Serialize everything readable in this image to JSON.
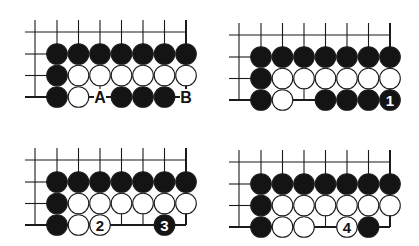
{
  "colors": {
    "background": "#ffffff",
    "line": "#1a1a1a",
    "black": "#141414",
    "white": "#ffffff"
  },
  "diagrams": [
    {
      "id": "diagram-1",
      "origin": [
        35,
        32
      ],
      "edge_right_col": 6,
      "bottom_edge_segments": [
        [
          -1,
          0
        ],
        [
          1,
          3
        ],
        [
          5,
          6
        ]
      ],
      "row_tops": [
        0,
        1,
        2,
        3,
        4,
        5,
        6
      ],
      "stones": [
        {
          "col": 0,
          "row": 0,
          "color": "black"
        },
        {
          "col": 1,
          "row": 0,
          "color": "black"
        },
        {
          "col": 2,
          "row": 0,
          "color": "black"
        },
        {
          "col": 3,
          "row": 0,
          "color": "black"
        },
        {
          "col": 4,
          "row": 0,
          "color": "black"
        },
        {
          "col": 5,
          "row": 0,
          "color": "black"
        },
        {
          "col": 6,
          "row": 0,
          "color": "black"
        },
        {
          "col": 0,
          "row": 1,
          "color": "black"
        },
        {
          "col": 1,
          "row": 1,
          "color": "white"
        },
        {
          "col": 2,
          "row": 1,
          "color": "white"
        },
        {
          "col": 3,
          "row": 1,
          "color": "white"
        },
        {
          "col": 4,
          "row": 1,
          "color": "white"
        },
        {
          "col": 5,
          "row": 1,
          "color": "white"
        },
        {
          "col": 6,
          "row": 1,
          "color": "white"
        },
        {
          "col": 0,
          "row": 2,
          "color": "black"
        },
        {
          "col": 1,
          "row": 2,
          "color": "white"
        },
        {
          "col": 3,
          "row": 2,
          "color": "black"
        },
        {
          "col": 4,
          "row": 2,
          "color": "black"
        },
        {
          "col": 5,
          "row": 2,
          "color": "black"
        }
      ],
      "labels": [
        {
          "col": 2,
          "row": 2,
          "text": "A"
        },
        {
          "col": 6,
          "row": 2,
          "text": "B"
        }
      ]
    },
    {
      "id": "diagram-2",
      "origin": [
        239,
        35
      ],
      "edge_right_col": 6,
      "bottom_edge_segments": [
        [
          -1,
          0
        ],
        [
          1,
          3
        ]
      ],
      "row_tops": [
        0,
        1,
        2,
        3,
        4,
        5,
        6
      ],
      "stones": [
        {
          "col": 0,
          "row": 0,
          "color": "black"
        },
        {
          "col": 1,
          "row": 0,
          "color": "black"
        },
        {
          "col": 2,
          "row": 0,
          "color": "black"
        },
        {
          "col": 3,
          "row": 0,
          "color": "black"
        },
        {
          "col": 4,
          "row": 0,
          "color": "black"
        },
        {
          "col": 5,
          "row": 0,
          "color": "black"
        },
        {
          "col": 6,
          "row": 0,
          "color": "black"
        },
        {
          "col": 0,
          "row": 1,
          "color": "black"
        },
        {
          "col": 1,
          "row": 1,
          "color": "white"
        },
        {
          "col": 2,
          "row": 1,
          "color": "white"
        },
        {
          "col": 3,
          "row": 1,
          "color": "white"
        },
        {
          "col": 4,
          "row": 1,
          "color": "white"
        },
        {
          "col": 5,
          "row": 1,
          "color": "white"
        },
        {
          "col": 6,
          "row": 1,
          "color": "white"
        },
        {
          "col": 0,
          "row": 2,
          "color": "black"
        },
        {
          "col": 1,
          "row": 2,
          "color": "white"
        },
        {
          "col": 3,
          "row": 2,
          "color": "black"
        },
        {
          "col": 4,
          "row": 2,
          "color": "black"
        },
        {
          "col": 5,
          "row": 2,
          "color": "black"
        },
        {
          "col": 6,
          "row": 2,
          "color": "black",
          "number": "1"
        }
      ],
      "labels": []
    },
    {
      "id": "diagram-3",
      "origin": [
        35,
        160
      ],
      "edge_right_col": 6,
      "bottom_edge_segments": [
        [
          -1,
          6
        ]
      ],
      "row_tops": [
        0,
        1,
        2,
        3,
        4,
        5,
        6
      ],
      "stones": [
        {
          "col": 0,
          "row": 0,
          "color": "black"
        },
        {
          "col": 1,
          "row": 0,
          "color": "black"
        },
        {
          "col": 2,
          "row": 0,
          "color": "black"
        },
        {
          "col": 3,
          "row": 0,
          "color": "black"
        },
        {
          "col": 4,
          "row": 0,
          "color": "black"
        },
        {
          "col": 5,
          "row": 0,
          "color": "black"
        },
        {
          "col": 6,
          "row": 0,
          "color": "black"
        },
        {
          "col": 0,
          "row": 1,
          "color": "black"
        },
        {
          "col": 1,
          "row": 1,
          "color": "white"
        },
        {
          "col": 2,
          "row": 1,
          "color": "white"
        },
        {
          "col": 3,
          "row": 1,
          "color": "white"
        },
        {
          "col": 4,
          "row": 1,
          "color": "white"
        },
        {
          "col": 5,
          "row": 1,
          "color": "white"
        },
        {
          "col": 6,
          "row": 1,
          "color": "white"
        },
        {
          "col": 0,
          "row": 2,
          "color": "black"
        },
        {
          "col": 1,
          "row": 2,
          "color": "white"
        },
        {
          "col": 2,
          "row": 2,
          "color": "white",
          "number": "2"
        },
        {
          "col": 5,
          "row": 2,
          "color": "black",
          "number": "3"
        }
      ],
      "labels": []
    },
    {
      "id": "diagram-4",
      "origin": [
        239,
        162
      ],
      "edge_right_col": 6,
      "bottom_edge_segments": [
        [
          -1,
          6
        ]
      ],
      "row_tops": [
        0,
        1,
        2,
        3,
        4,
        5,
        6
      ],
      "stones": [
        {
          "col": 0,
          "row": 0,
          "color": "black"
        },
        {
          "col": 1,
          "row": 0,
          "color": "black"
        },
        {
          "col": 2,
          "row": 0,
          "color": "black"
        },
        {
          "col": 3,
          "row": 0,
          "color": "black"
        },
        {
          "col": 4,
          "row": 0,
          "color": "black"
        },
        {
          "col": 5,
          "row": 0,
          "color": "black"
        },
        {
          "col": 6,
          "row": 0,
          "color": "black"
        },
        {
          "col": 0,
          "row": 1,
          "color": "black"
        },
        {
          "col": 1,
          "row": 1,
          "color": "white"
        },
        {
          "col": 2,
          "row": 1,
          "color": "white"
        },
        {
          "col": 3,
          "row": 1,
          "color": "white"
        },
        {
          "col": 4,
          "row": 1,
          "color": "white"
        },
        {
          "col": 5,
          "row": 1,
          "color": "white"
        },
        {
          "col": 6,
          "row": 1,
          "color": "white"
        },
        {
          "col": 0,
          "row": 2,
          "color": "black"
        },
        {
          "col": 1,
          "row": 2,
          "color": "white"
        },
        {
          "col": 2,
          "row": 2,
          "color": "white"
        },
        {
          "col": 4,
          "row": 2,
          "color": "white",
          "number": "4"
        },
        {
          "col": 5,
          "row": 2,
          "color": "black"
        }
      ],
      "labels": []
    }
  ],
  "grid": {
    "spacing": 21.5,
    "first_col_offset": 22,
    "first_row_offset": 22,
    "stone_radius": 10.3,
    "top_stub": 12,
    "left_stub": 10
  }
}
